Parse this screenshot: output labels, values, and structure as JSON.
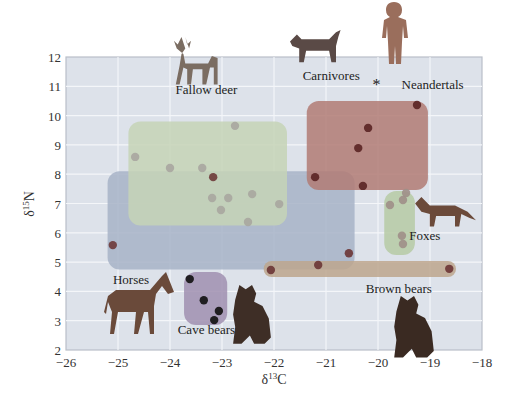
{
  "chart_data": {
    "type": "scatter",
    "title": "",
    "xlabel": "δ13C",
    "ylabel": "δ15N",
    "xlim": [
      -26,
      -18
    ],
    "ylim": [
      2,
      12
    ],
    "xticks": [
      -26,
      -25,
      -24,
      -23,
      -22,
      -21,
      -20,
      -19,
      -18
    ],
    "yticks": [
      2,
      3,
      4,
      5,
      6,
      7,
      8,
      9,
      10,
      11,
      12
    ],
    "grid": true,
    "legend": "none (direct labels)",
    "colors": {
      "plot_bg": "#dde2ea",
      "grid": "#f4f6f9",
      "frame": "#b9bfc8"
    },
    "groups": [
      {
        "name": "Horses",
        "label_pos": [
          -24.75,
          4.25
        ],
        "box": {
          "x": [
            -25.2,
            -20.45
          ],
          "y": [
            4.75,
            8.1
          ]
        },
        "box_color": "#a7b3c7",
        "point_color": "#6e3a3a",
        "points": [
          [
            -23.17,
            7.9
          ],
          [
            -25.1,
            5.58
          ]
        ]
      },
      {
        "name": "Fallow deer",
        "label_pos": [
          -23.3,
          10.75
        ],
        "box": {
          "x": [
            -24.8,
            -21.75
          ],
          "y": [
            6.25,
            9.8
          ]
        },
        "box_color": "#c6d3b6",
        "point_color": "#a9a6a0",
        "points": [
          [
            -24.67,
            8.59
          ],
          [
            -24.0,
            8.21
          ],
          [
            -23.38,
            8.21
          ],
          [
            -22.75,
            9.65
          ],
          [
            -23.19,
            7.19
          ],
          [
            -22.88,
            7.19
          ],
          [
            -22.42,
            7.32
          ],
          [
            -23.02,
            6.78
          ],
          [
            -22.5,
            6.37
          ],
          [
            -21.9,
            6.98
          ]
        ]
      },
      {
        "name": "Carnivores",
        "label_pos": [
          -20.9,
          11.2
        ],
        "box": {
          "x": [
            -21.37,
            -19.04
          ],
          "y": [
            7.46,
            10.5
          ]
        },
        "box_color": "#b27b74",
        "point_color": "#5a2424",
        "points": [
          [
            -19.25,
            10.36
          ],
          [
            -20.19,
            9.58
          ],
          [
            -20.38,
            8.89
          ],
          [
            -21.21,
            7.9
          ],
          [
            -20.29,
            7.6
          ]
        ]
      },
      {
        "name": "Foxes",
        "label_pos": [
          -19.1,
          5.75
        ],
        "box": {
          "x": [
            -19.88,
            -19.29
          ],
          "y": [
            5.24,
            7.43
          ]
        },
        "box_color": "#b6caa4",
        "point_color": "#9f8f88",
        "points": [
          [
            -19.77,
            6.95
          ],
          [
            -19.52,
            7.12
          ],
          [
            -19.46,
            7.36
          ],
          [
            -19.54,
            5.9
          ],
          [
            -19.52,
            5.62
          ]
        ]
      },
      {
        "name": "Brown bears",
        "label_pos": [
          -19.6,
          3.95
        ],
        "box": {
          "x": [
            -22.2,
            -18.5
          ],
          "y": [
            4.49,
            5.04
          ]
        },
        "box_color": "#bda68d",
        "point_color": "#6b3535",
        "points": [
          [
            -22.06,
            4.73
          ],
          [
            -21.15,
            4.9
          ],
          [
            -18.63,
            4.77
          ],
          [
            -20.56,
            5.3
          ]
        ]
      },
      {
        "name": "Cave bears",
        "label_pos": [
          -23.3,
          2.55
        ],
        "box": {
          "x": [
            -23.73,
            -22.9
          ],
          "y": [
            2.85,
            4.66
          ]
        },
        "box_color": "#a08fb0",
        "point_color": "#111111",
        "points": [
          [
            -23.62,
            4.42
          ],
          [
            -23.35,
            3.7
          ],
          [
            -23.06,
            3.33
          ],
          [
            -23.15,
            3.02
          ]
        ]
      },
      {
        "name": "Neandertals",
        "label_pos": [
          -18.95,
          10.9
        ],
        "marker": "*",
        "points": [
          [
            -20.03,
            11.04
          ]
        ]
      }
    ]
  },
  "illustrations": [
    {
      "name": "fallow-deer-illustration",
      "label": "Fallow deer"
    },
    {
      "name": "carnivore-cat-illustration",
      "label": "Carnivores"
    },
    {
      "name": "neandertal-illustration",
      "label": "Neandertals"
    },
    {
      "name": "fox-illustration",
      "label": "Foxes"
    },
    {
      "name": "horse-illustration",
      "label": "Horses"
    },
    {
      "name": "cave-bear-illustration",
      "label": "Cave bears"
    },
    {
      "name": "brown-bear-illustration",
      "label": "Brown bears"
    }
  ]
}
